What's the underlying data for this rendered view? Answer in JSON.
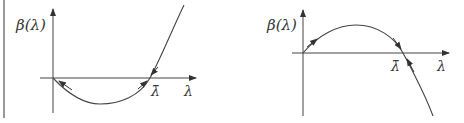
{
  "figure": {
    "colors": {
      "ink": "#333333",
      "background": "#ffffff"
    },
    "panels": [
      {
        "id": "left",
        "ylabel": "β(λ)",
        "xlabel": "λ",
        "root_label": "λ̄",
        "shape": "convex (dips below axis then rises)",
        "arrows": "trajectories move away from the root λ̄ toward 0 (unstable root)"
      },
      {
        "id": "right",
        "ylabel": "β(λ)",
        "xlabel": "λ",
        "root_label": "λ̄",
        "shape": "concave (rises above axis then falls)",
        "arrows": "trajectories move toward the root λ̄ (stable root)"
      }
    ]
  }
}
